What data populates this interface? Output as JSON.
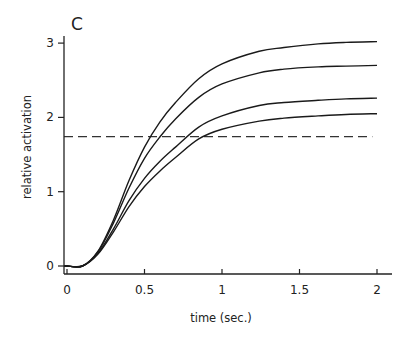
{
  "chart_data": {
    "type": "line",
    "panel_label": "C",
    "title": "",
    "xlabel": "time (sec.)",
    "ylabel": "relative activation",
    "xlim": [
      0,
      2.05
    ],
    "ylim": [
      -0.08,
      3.1
    ],
    "x_ticks": [
      0,
      0.5,
      1,
      1.5,
      2
    ],
    "x_tick_labels": [
      "0",
      "0.5",
      "1",
      "1.5",
      "2"
    ],
    "y_ticks": [
      0,
      1,
      2,
      3
    ],
    "y_tick_labels": [
      "0",
      "1",
      "2",
      "3"
    ],
    "grid": false,
    "legend": null,
    "x": [
      0,
      0.1,
      0.2,
      0.3,
      0.4,
      0.5,
      0.6,
      0.7,
      0.85,
      1.0,
      1.24,
      1.4,
      1.62,
      1.8,
      2.0
    ],
    "series": [
      {
        "name": "curve-1",
        "values": [
          0,
          0,
          0.2,
          0.62,
          1.15,
          1.6,
          1.94,
          2.2,
          2.52,
          2.72,
          2.89,
          2.94,
          2.99,
          3.01,
          3.02
        ]
      },
      {
        "name": "curve-2",
        "values": [
          0,
          0,
          0.19,
          0.58,
          1.05,
          1.45,
          1.74,
          1.98,
          2.27,
          2.45,
          2.6,
          2.65,
          2.68,
          2.69,
          2.7
        ]
      },
      {
        "name": "curve-3",
        "values": [
          0,
          0,
          0.17,
          0.5,
          0.88,
          1.18,
          1.41,
          1.6,
          1.87,
          2.02,
          2.16,
          2.2,
          2.23,
          2.25,
          2.26
        ]
      },
      {
        "name": "curve-4",
        "values": [
          0,
          0,
          0.16,
          0.46,
          0.8,
          1.07,
          1.28,
          1.46,
          1.71,
          1.84,
          1.95,
          1.99,
          2.02,
          2.04,
          2.05
        ]
      }
    ],
    "threshold_line": {
      "y": 1.74,
      "x_range": [
        0,
        1.97
      ],
      "style": "dashed"
    }
  }
}
